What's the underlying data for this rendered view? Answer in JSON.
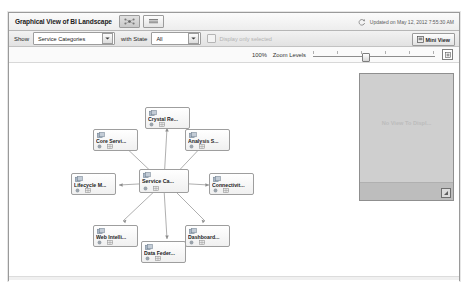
{
  "window": {
    "title": "Graphical View of BI Landscape",
    "updated_text": "Updated on May 12, 2012 7:55:30 AM",
    "view_buttons": [
      {
        "name": "graph-view",
        "icon": "graph-view-icon",
        "active": true
      },
      {
        "name": "list-view",
        "icon": "list-view-icon",
        "active": false
      }
    ],
    "refresh_icon": "refresh-icon"
  },
  "toolbar": {
    "show_label": "Show",
    "category_select": {
      "value": "Service Categories",
      "icon": "chevron-down-icon"
    },
    "state_label": "with State",
    "state_select": {
      "value": "All",
      "icon": "chevron-down-icon"
    },
    "display_only_selected": {
      "label": "Display only selected",
      "checked": false,
      "disabled": true
    },
    "mini_view_button": {
      "label": "Mini View",
      "icon": "mini-view-icon"
    }
  },
  "zoom": {
    "percent": "100%",
    "label": "Zoom Levels",
    "slider_value": 40,
    "fit_icon": "fit-to-screen-icon"
  },
  "graph": {
    "center": {
      "label": "Service Ca...",
      "icon": "service-node-icon",
      "badge_icons": [
        "status-icon",
        "grid-icon"
      ]
    },
    "nodes": [
      {
        "label": "Crystal Re...",
        "icon": "service-node-icon",
        "badge_icons": [
          "status-icon",
          "grid-icon"
        ]
      },
      {
        "label": "Core Servi...",
        "icon": "service-node-icon",
        "badge_icons": [
          "status-icon",
          "grid-icon"
        ]
      },
      {
        "label": "Analysis S...",
        "icon": "service-node-icon",
        "badge_icons": [
          "status-icon",
          "grid-icon"
        ]
      },
      {
        "label": "Lifecycle M...",
        "icon": "service-node-icon",
        "badge_icons": [
          "status-icon",
          "grid-icon"
        ]
      },
      {
        "label": "Connectivit...",
        "icon": "service-node-icon",
        "badge_icons": [
          "status-icon",
          "grid-icon"
        ]
      },
      {
        "label": "Web Intelli...",
        "icon": "service-node-icon",
        "badge_icons": [
          "status-icon",
          "grid-icon"
        ]
      },
      {
        "label": "Dashboard...",
        "icon": "service-node-icon",
        "badge_icons": [
          "status-icon",
          "grid-icon"
        ]
      },
      {
        "label": "Data Feder...",
        "icon": "service-node-icon",
        "badge_icons": [
          "status-icon",
          "grid-icon"
        ]
      }
    ]
  },
  "mini_view_panel": {
    "empty_text": "No View To Displ...",
    "resize_icon": "resize-handle-icon"
  }
}
